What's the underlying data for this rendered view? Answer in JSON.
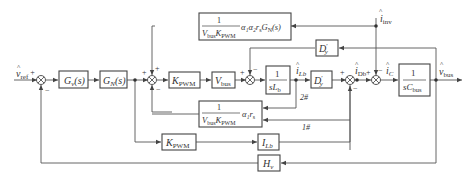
{
  "diagram": {
    "inputs": {
      "v_ref": {
        "symbol": "v",
        "hat": "^",
        "sub": "ref",
        "sign": "+"
      },
      "i_inv": {
        "symbol": "i",
        "hat": "^",
        "sub": "inv"
      }
    },
    "output": {
      "symbol": "v",
      "hat": "^",
      "sub": "bus"
    },
    "blocks": {
      "Gv": {
        "main": "G",
        "sub": "v",
        "tail": "(s)"
      },
      "GN": {
        "main": "G",
        "sub": "N",
        "tail": "(s)"
      },
      "KPWM_fwd": {
        "main": "K",
        "sub": "PWM"
      },
      "Vbus": {
        "main": "V",
        "sub": "bus"
      },
      "inductor": {
        "num": "1",
        "den_main": "sL",
        "den_sub": "b"
      },
      "Dy_fwd": {
        "main": "D",
        "sup": "′",
        "sub": "y"
      },
      "Dy_fb": {
        "main": "D",
        "sup": "′",
        "sub": "y"
      },
      "capacitor": {
        "num": "1",
        "den_main": "sC",
        "den_sub": "bus"
      },
      "top_ff": {
        "num": "1",
        "den": "V",
        "den_sub1": "bus",
        "den2": "K",
        "den_sub2": "PWM",
        "tail": "α₁α₂r",
        "tail_sub": "s",
        "tail2": "G",
        "tail2_sub": "N",
        "tail3": "(s)"
      },
      "mid_fb": {
        "num": "1",
        "den": "V",
        "den_sub1": "bus",
        "den2": "K",
        "den_sub2": "PWM",
        "tail": "α₁r",
        "tail_sub": "s"
      },
      "KPWM_low": {
        "main": "K",
        "sub": "PWM"
      },
      "ILb": {
        "main": "I",
        "sub": "Lb"
      },
      "Hv": {
        "main": "H",
        "sub": "v"
      }
    },
    "signals": {
      "iLb": {
        "symbol": "i",
        "hat": "^",
        "sub": "Lb"
      },
      "iDb": {
        "symbol": "i",
        "hat": "^",
        "sub": "Db"
      },
      "iC": {
        "symbol": "i",
        "hat": "^",
        "sub": "C"
      }
    },
    "path_labels": {
      "path2": "2#",
      "path1": "1#"
    },
    "signs": {
      "plus": "+",
      "minus": "−"
    }
  }
}
